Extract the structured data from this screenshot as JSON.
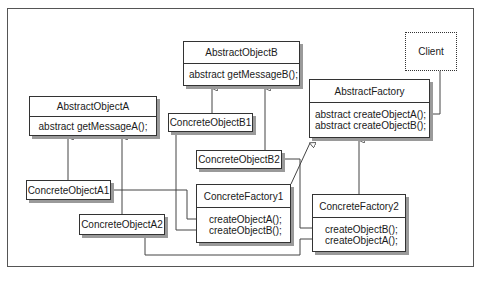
{
  "diagram": {
    "type": "UML class diagram (Abstract Factory pattern)",
    "client": {
      "label": "Client"
    },
    "abstract_object_a": {
      "name": "AbstractObjectA",
      "methods": [
        "abstract getMessageA();"
      ]
    },
    "abstract_object_b": {
      "name": "AbstractObjectB",
      "methods": [
        "abstract getMessageB();"
      ]
    },
    "abstract_factory": {
      "name": "AbstractFactory",
      "methods": [
        "abstract createObjectA();",
        "abstract createObjectB();"
      ]
    },
    "concrete_object_a1": {
      "name": "ConcreteObjectA1"
    },
    "concrete_object_a2": {
      "name": "ConcreteObjectA2"
    },
    "concrete_object_b1": {
      "name": "ConcreteObjectB1"
    },
    "concrete_object_b2": {
      "name": "ConcreteObjectB2"
    },
    "concrete_factory_1": {
      "name": "ConcreteFactory1",
      "methods": [
        "createObjectA();",
        "createObjectB();"
      ]
    },
    "concrete_factory_2": {
      "name": "ConcreteFactory2",
      "methods": [
        "createObjectB();",
        "createObjectA();"
      ]
    },
    "relationships": [
      {
        "from": "ConcreteObjectA1",
        "to": "AbstractObjectA",
        "kind": "inheritance"
      },
      {
        "from": "ConcreteObjectA2",
        "to": "AbstractObjectA",
        "kind": "inheritance"
      },
      {
        "from": "ConcreteObjectB1",
        "to": "AbstractObjectB",
        "kind": "inheritance"
      },
      {
        "from": "ConcreteObjectB2",
        "to": "AbstractObjectB",
        "kind": "inheritance"
      },
      {
        "from": "ConcreteFactory1",
        "to": "AbstractFactory",
        "kind": "inheritance"
      },
      {
        "from": "ConcreteFactory2",
        "to": "AbstractFactory",
        "kind": "inheritance"
      },
      {
        "from": "Client",
        "to": "AbstractFactory",
        "kind": "association"
      },
      {
        "from": "ConcreteFactory1.createObjectA",
        "to": "ConcreteObjectA1",
        "kind": "creates"
      },
      {
        "from": "ConcreteFactory1.createObjectB",
        "to": "ConcreteObjectB1",
        "kind": "creates"
      },
      {
        "from": "ConcreteFactory2.createObjectB",
        "to": "ConcreteObjectB2",
        "kind": "creates"
      },
      {
        "from": "ConcreteFactory2.createObjectA",
        "to": "ConcreteObjectA2",
        "kind": "creates"
      }
    ]
  }
}
